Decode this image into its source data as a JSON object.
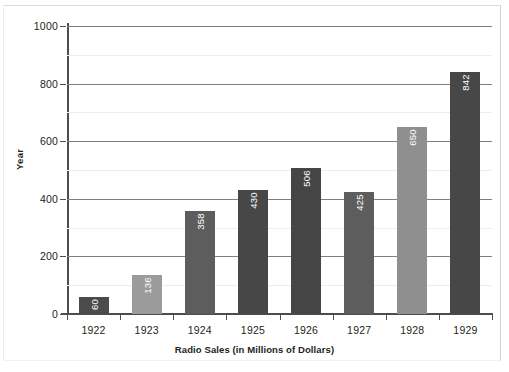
{
  "chart_data": {
    "type": "bar",
    "title": "",
    "subtitle": "",
    "xlabel": "Radio Sales (in Millions of Dollars)",
    "ylabel": "Year",
    "categories": [
      "1922",
      "1923",
      "1924",
      "1925",
      "1926",
      "1927",
      "1928",
      "1929"
    ],
    "values": [
      60,
      136,
      358,
      430,
      506,
      425,
      650,
      842
    ],
    "bar_labels": [
      "60",
      "136",
      "358",
      "430",
      "506",
      "425",
      "650",
      "842"
    ],
    "bar_colors": [
      "#4b4b4b",
      "#9b9b9b",
      "#5d5d5d",
      "#474747",
      "#454545",
      "#5d5d5d",
      "#8f8f8f",
      "#474747"
    ],
    "ylim": [
      0,
      1000
    ],
    "yticks": [
      0,
      200,
      400,
      600,
      800,
      1000
    ],
    "ytick_labels": [
      "0",
      "200",
      "400",
      "600",
      "800",
      "1000"
    ],
    "minor_yticks": [
      100,
      300,
      500,
      700,
      900
    ],
    "grid": "horizontal-major-and-minor",
    "legend": "none",
    "value_label_rotation": -90,
    "value_label_color": "#ffffff",
    "axis_color": "#4d4d4d",
    "gridline_color": "#808080",
    "minor_gridline_color": "#ededed",
    "background": "#ffffff"
  }
}
